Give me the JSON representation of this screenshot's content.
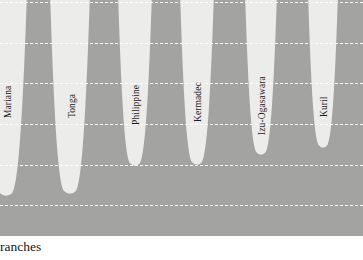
{
  "figure": {
    "caption_clipped": "ranches",
    "background_color": "#ececea",
    "seafloor_color": "#a3a3a1",
    "trench_color": "#e9e9e6",
    "gridline_color": "#ffffff"
  },
  "chart_data": {
    "type": "area",
    "title": "",
    "subtitle": "",
    "xlabel": "",
    "ylabel": "",
    "grid": true,
    "legend": "none",
    "orientation": "depth-profile-downward",
    "note": "Grey mass is the solid Earth / seafloor; white notches are ocean trenches cutting downward. Image is cropped at top and bottom.",
    "gridlines_px_y": [
      2,
      43,
      83,
      124,
      165,
      205
    ],
    "categories": [
      "Mariana",
      "Tonga",
      "Philippine",
      "Kermadec",
      "Izu-Ogasawara",
      "Kuril"
    ],
    "series": [
      {
        "name": "Trench depth (relative, px from top of crop)",
        "values": [
          196,
          194,
          166,
          165,
          155,
          148
        ]
      },
      {
        "name": "Trench center x (px)",
        "values": [
          6,
          70,
          135,
          197,
          261,
          323
        ]
      },
      {
        "name": "Trench half-width at rim (px)",
        "values": [
          21,
          20,
          17,
          17,
          16,
          15
        ]
      }
    ],
    "labels": [
      {
        "text": "Mariana",
        "x": 6,
        "tip_y": 196,
        "half_width": 21
      },
      {
        "text": "Tonga",
        "x": 70,
        "tip_y": 194,
        "half_width": 20
      },
      {
        "text": "Philippine",
        "x": 135,
        "tip_y": 166,
        "half_width": 17
      },
      {
        "text": "Kermadec",
        "x": 197,
        "tip_y": 165,
        "half_width": 17
      },
      {
        "text": "Izu-Ogasawara",
        "x": 261,
        "tip_y": 155,
        "half_width": 16
      },
      {
        "text": "Kuril",
        "x": 323,
        "tip_y": 148,
        "half_width": 15
      }
    ]
  },
  "trench_labels": {
    "mariana": "Mariana",
    "tonga": "Tonga",
    "philippine": "Philippine",
    "kermadec": "Kermadec",
    "izu_ogasawara": "Izu-Ogasawara",
    "kuril": "Kuril"
  }
}
